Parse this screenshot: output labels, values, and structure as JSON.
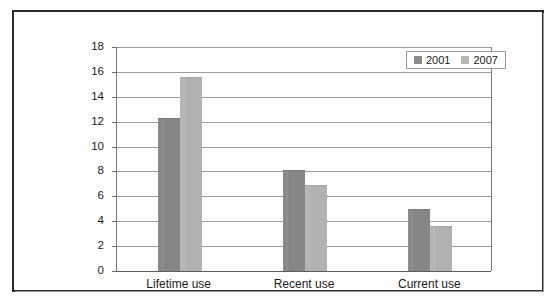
{
  "chart_data": {
    "type": "bar",
    "title": "",
    "subtitle": "",
    "xlabel": "",
    "ylabel": "",
    "categories": [
      "Lifetime use",
      "Recent use",
      "Current use"
    ],
    "series": [
      {
        "name": "2001",
        "color": "#8b8b8b",
        "values": [
          12.2,
          8.0,
          4.9
        ]
      },
      {
        "name": "2007",
        "color": "#b7b7b7",
        "values": [
          15.5,
          6.8,
          3.5
        ]
      }
    ],
    "ylim": [
      0,
      18
    ],
    "ytick_step": 2,
    "ytick_labels": [
      "0",
      "2",
      "4",
      "6",
      "8",
      "10",
      "12",
      "14",
      "16",
      "18"
    ],
    "grid": true,
    "legend_position": "top-right",
    "annotations": []
  },
  "legend": {
    "entries": [
      {
        "label": "2001",
        "swatch": "legend-swatch-2001"
      },
      {
        "label": "2007",
        "swatch": "legend-swatch-2007"
      }
    ]
  },
  "colors": {
    "series_2001": "#8b8b8b",
    "series_2007": "#b7b7b7",
    "gridline": "#9c9c9c",
    "axis": "#5c5c5c",
    "frame": "#2b2b2b",
    "text": "#1c1c1c",
    "background": "#ffffff"
  }
}
